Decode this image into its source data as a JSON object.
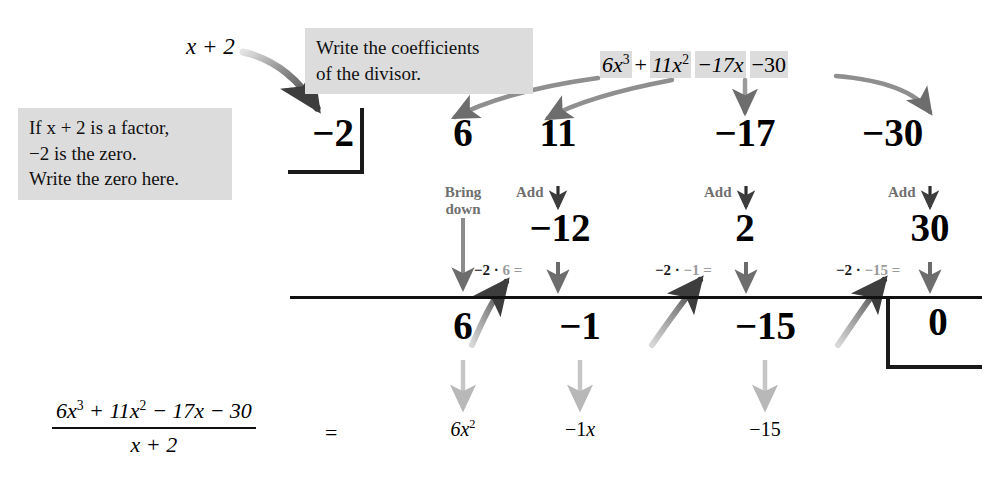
{
  "colors": {
    "highlight": "#dcdcdc",
    "ink": "#111111",
    "grey_label": "#6f6f6f",
    "arrow_grey": "#7a7a7a",
    "arrow_light": "#bcbcbc"
  },
  "callouts": {
    "zero_note_line1": "If x + 2 is a factor,",
    "zero_note_line2": "−2 is the zero.",
    "zero_note_line3": "Write the zero here.",
    "coefficients_note_line1": "Write the coefficients",
    "coefficients_note_line2": "of the divisor."
  },
  "divisor": {
    "expression": "x + 2",
    "zero_value": "−2"
  },
  "dividend": {
    "term1": "6x",
    "term1_exp": "3",
    "plus": "+",
    "term2": "11x",
    "term2_exp": "2",
    "term3": "−17x",
    "term4": "−30"
  },
  "synthetic_table": {
    "coefficient_row": [
      "6",
      "11",
      "−17",
      "−30"
    ],
    "product_row": [
      "−12",
      "2",
      "30"
    ],
    "result_row": [
      "6",
      "−1",
      "−15"
    ],
    "remainder": "0"
  },
  "operation_labels": {
    "bring_down_line1": "Bring",
    "bring_down_line2": "down",
    "add1": "Add",
    "add2": "Add",
    "add3": "Add",
    "mult1": {
      "dark": "−2 ·",
      "lite": "6 ="
    },
    "mult2": {
      "dark": "−2 ·",
      "lite": "−1 ="
    },
    "mult3": {
      "dark": "−2 ·",
      "lite": "−15 ="
    }
  },
  "bottom_equation": {
    "numerator_a": "6x",
    "numerator_a_exp": "3",
    "numerator_b": " + 11x",
    "numerator_b_exp": "2",
    "numerator_c": " − 17x − 30",
    "denominator": "x + 2",
    "equals": "=",
    "answer_term1": "6x",
    "answer_term1_exp": "2",
    "answer_term2": "−1x",
    "answer_term3": "−15"
  }
}
